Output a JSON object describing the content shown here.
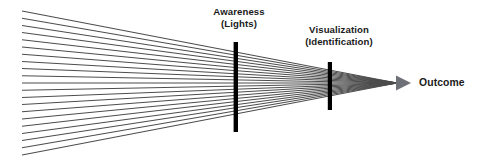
{
  "figure": {
    "title_present": false,
    "background_color": "#ffffff",
    "stroke_color": "#4d4d4d",
    "bar_color": "#000000",
    "arrow_color": "#6e7177",
    "text_color": "#1a1a1a",
    "labels": {
      "awareness": {
        "line1": "Awareness",
        "line2": "(Lights)"
      },
      "visualization": {
        "line1": "Visualization",
        "line2": "(Identification)"
      },
      "outcome": "Outcome"
    },
    "geometry": {
      "ray_count": 21,
      "origin_x": 22,
      "origin_top_y": 11,
      "origin_bottom_y": 155,
      "apex_x": 397,
      "apex_y": 83,
      "bar1_x": 236,
      "bar1_top_y": 42,
      "bar1_bottom_y": 132,
      "bar2_x": 330,
      "bar2_top_y": 62,
      "bar2_bottom_y": 110,
      "arrow_tip_x": 411,
      "arrow_head_width": 15
    }
  }
}
